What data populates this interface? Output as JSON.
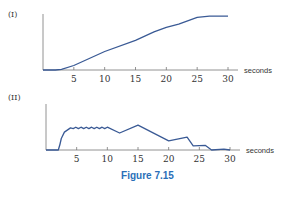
{
  "figure": {
    "caption": "Figure 7.15",
    "caption_color": "#2a6fb8",
    "line_color": "#3a5a95"
  },
  "chart_data": [
    {
      "type": "line",
      "title": "(I)",
      "xlabel": "seconds",
      "ylabel": "",
      "xlim": [
        0,
        30
      ],
      "ylim": [
        0,
        10
      ],
      "xticks": [
        5,
        10,
        15,
        20,
        25,
        30
      ],
      "grid": false,
      "x": [
        0,
        2,
        3,
        5,
        10,
        15,
        18,
        20,
        22,
        25,
        27,
        30
      ],
      "values": [
        0,
        0,
        0.1,
        0.8,
        3.3,
        5.3,
        6.8,
        7.6,
        8.2,
        9.4,
        9.6,
        9.6
      ]
    },
    {
      "type": "line",
      "title": "(II)",
      "xlabel": "seconds",
      "ylabel": "",
      "xlim": [
        0,
        30
      ],
      "ylim": [
        0,
        10
      ],
      "xticks": [
        5,
        10,
        15,
        20,
        25,
        30
      ],
      "grid": false,
      "x": [
        0,
        2,
        2.5,
        3,
        4,
        10,
        12,
        15,
        20,
        23,
        24,
        26,
        27,
        29,
        30
      ],
      "values": [
        0,
        0,
        2.5,
        3.9,
        4.8,
        4.8,
        3.7,
        5.4,
        2.0,
        2.8,
        0.9,
        1.0,
        0,
        0.2,
        0
      ],
      "annotations": [
        "small oscillation on plateau between t≈4 and t≈10"
      ]
    }
  ]
}
